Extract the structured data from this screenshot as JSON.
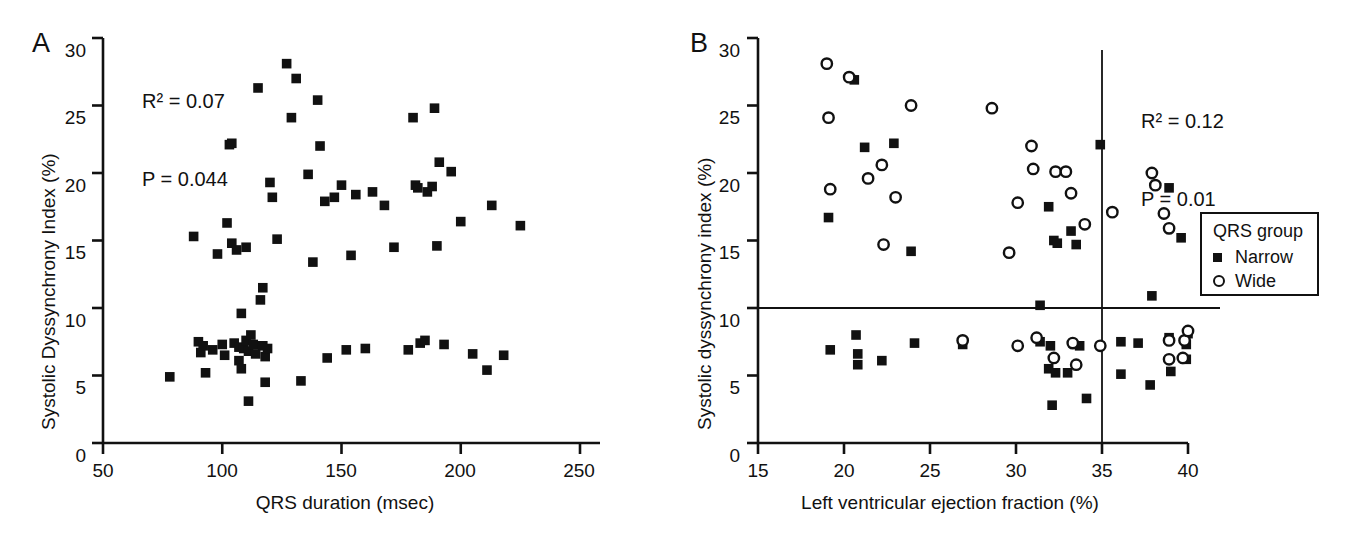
{
  "figure": {
    "background": "#ffffff",
    "ink": "#111111"
  },
  "panels": [
    {
      "id": "A",
      "letter": "A",
      "stats": {
        "r2_label": "R",
        "r2_sup": "2",
        "r2_value": "R² = 0.07",
        "p_value": "P = 0.044"
      },
      "axes": {
        "xlabel": "QRS duration (msec)",
        "ylabel": "Systolic Dyssynchrony Index (%)",
        "xticks": [
          "50",
          "100",
          "150",
          "200",
          "250"
        ],
        "yticks": [
          "0",
          "5",
          "10",
          "15",
          "20",
          "25",
          "30"
        ]
      }
    },
    {
      "id": "B",
      "letter": "B",
      "stats": {
        "r2_value": "R² = 0.12",
        "p_value": "P = 0.01"
      },
      "axes": {
        "xlabel": "Left ventricular ejection fraction (%)",
        "ylabel": "Systolic dyssynchrony index (%)",
        "xticks": [
          "15",
          "20",
          "25",
          "30",
          "35",
          "40"
        ],
        "yticks": [
          "0",
          "5",
          "10",
          "15",
          "20",
          "25",
          "30"
        ]
      }
    }
  ],
  "legend": {
    "title": "QRS group",
    "entries": [
      {
        "marker": "filled-square",
        "label": "Narrow"
      },
      {
        "marker": "open-circle",
        "label": "Wide"
      }
    ]
  },
  "chart_data": [
    {
      "type": "scatter",
      "panel": "A",
      "title": "",
      "xlabel": "QRS duration (msec)",
      "ylabel": "Systolic Dyssynchrony Index (%)",
      "xlim": [
        50,
        250
      ],
      "ylim": [
        0,
        30
      ],
      "xticks": [
        50,
        100,
        150,
        200,
        250
      ],
      "yticks": [
        0,
        5,
        10,
        15,
        20,
        25,
        30
      ],
      "grid": false,
      "legend": "none",
      "annotations": [
        "R² = 0.07",
        "P = 0.044"
      ],
      "series": [
        {
          "name": "All patients",
          "marker": "filled-square",
          "points": [
            [
              78,
              4.9
            ],
            [
              88,
              15.3
            ],
            [
              90,
              7.5
            ],
            [
              91,
              6.7
            ],
            [
              92,
              7.2
            ],
            [
              93,
              5.2
            ],
            [
              96,
              6.9
            ],
            [
              98,
              14.0
            ],
            [
              100,
              7.3
            ],
            [
              101,
              6.5
            ],
            [
              102,
              16.3
            ],
            [
              103,
              22.1
            ],
            [
              104,
              22.2
            ],
            [
              104,
              14.8
            ],
            [
              105,
              7.4
            ],
            [
              106,
              14.3
            ],
            [
              107,
              7.1
            ],
            [
              107,
              6.1
            ],
            [
              108,
              9.6
            ],
            [
              108,
              5.5
            ],
            [
              109,
              7.0
            ],
            [
              110,
              7.6
            ],
            [
              110,
              14.5
            ],
            [
              111,
              6.8
            ],
            [
              111,
              3.1
            ],
            [
              112,
              8.0
            ],
            [
              113,
              7.3
            ],
            [
              114,
              6.6
            ],
            [
              115,
              26.3
            ],
            [
              116,
              10.6
            ],
            [
              117,
              11.5
            ],
            [
              117,
              7.2
            ],
            [
              118,
              6.4
            ],
            [
              118,
              4.5
            ],
            [
              119,
              7.0
            ],
            [
              120,
              19.3
            ],
            [
              121,
              18.2
            ],
            [
              123,
              15.1
            ],
            [
              127,
              28.1
            ],
            [
              129,
              24.1
            ],
            [
              131,
              27.0
            ],
            [
              133,
              4.6
            ],
            [
              136,
              19.9
            ],
            [
              138,
              13.4
            ],
            [
              140,
              25.4
            ],
            [
              141,
              22.0
            ],
            [
              143,
              17.9
            ],
            [
              144,
              6.3
            ],
            [
              147,
              18.2
            ],
            [
              150,
              19.1
            ],
            [
              152,
              6.9
            ],
            [
              154,
              13.9
            ],
            [
              156,
              18.4
            ],
            [
              160,
              7.0
            ],
            [
              163,
              18.6
            ],
            [
              168,
              17.6
            ],
            [
              172,
              14.5
            ],
            [
              178,
              6.9
            ],
            [
              180,
              24.1
            ],
            [
              181,
              19.1
            ],
            [
              182,
              18.9
            ],
            [
              183,
              7.4
            ],
            [
              185,
              7.6
            ],
            [
              186,
              18.6
            ],
            [
              188,
              19.0
            ],
            [
              189,
              24.8
            ],
            [
              190,
              14.6
            ],
            [
              191,
              20.8
            ],
            [
              193,
              7.3
            ],
            [
              196,
              20.1
            ],
            [
              200,
              16.4
            ],
            [
              205,
              6.6
            ],
            [
              211,
              5.4
            ],
            [
              213,
              17.6
            ],
            [
              218,
              6.5
            ],
            [
              225,
              16.1
            ]
          ]
        }
      ]
    },
    {
      "type": "scatter",
      "panel": "B",
      "title": "",
      "xlabel": "Left ventricular ejection fraction (%)",
      "ylabel": "Systolic dyssynchrony index (%)",
      "xlim": [
        15,
        40
      ],
      "ylim": [
        0,
        30
      ],
      "xticks": [
        15,
        20,
        25,
        30,
        35,
        40
      ],
      "yticks": [
        0,
        5,
        10,
        15,
        20,
        25,
        30
      ],
      "grid": false,
      "legend": "right-outside",
      "annotations": [
        "R² = 0.12",
        "P = 0.01"
      ],
      "reference_lines": [
        {
          "orientation": "horizontal",
          "value": 10
        },
        {
          "orientation": "vertical",
          "value": 35
        }
      ],
      "series": [
        {
          "name": "Narrow",
          "marker": "filled-square",
          "points": [
            [
              19.1,
              16.7
            ],
            [
              20.6,
              26.9
            ],
            [
              21.2,
              21.9
            ],
            [
              22.9,
              22.2
            ],
            [
              23.9,
              14.2
            ],
            [
              31.4,
              10.2
            ],
            [
              31.9,
              17.5
            ],
            [
              32.2,
              15.0
            ],
            [
              32.4,
              14.8
            ],
            [
              33.2,
              15.7
            ],
            [
              33.5,
              14.7
            ],
            [
              34.9,
              22.1
            ],
            [
              37.9,
              10.9
            ],
            [
              38.9,
              18.9
            ],
            [
              39.6,
              15.2
            ],
            [
              19.2,
              6.9
            ],
            [
              20.7,
              8.0
            ],
            [
              20.8,
              6.6
            ],
            [
              20.8,
              5.8
            ],
            [
              22.2,
              6.1
            ],
            [
              24.1,
              7.4
            ],
            [
              26.9,
              7.3
            ],
            [
              31.4,
              7.5
            ],
            [
              32.0,
              7.2
            ],
            [
              31.9,
              5.5
            ],
            [
              32.3,
              5.2
            ],
            [
              32.1,
              2.8
            ],
            [
              33.0,
              5.2
            ],
            [
              33.7,
              7.2
            ],
            [
              34.1,
              3.3
            ],
            [
              36.1,
              7.5
            ],
            [
              36.1,
              5.1
            ],
            [
              37.1,
              7.4
            ],
            [
              37.8,
              4.3
            ],
            [
              38.9,
              7.8
            ],
            [
              39.0,
              5.3
            ],
            [
              39.9,
              7.3
            ],
            [
              39.9,
              6.2
            ],
            [
              40.0,
              8.1
            ]
          ]
        },
        {
          "name": "Wide",
          "marker": "open-circle",
          "points": [
            [
              19.0,
              28.1
            ],
            [
              19.1,
              24.1
            ],
            [
              20.3,
              27.1
            ],
            [
              19.2,
              18.8
            ],
            [
              21.4,
              19.6
            ],
            [
              22.2,
              20.6
            ],
            [
              22.3,
              14.7
            ],
            [
              23.0,
              18.2
            ],
            [
              23.9,
              25.0
            ],
            [
              28.6,
              24.8
            ],
            [
              29.6,
              14.1
            ],
            [
              30.1,
              17.8
            ],
            [
              30.9,
              22.0
            ],
            [
              31.0,
              20.3
            ],
            [
              32.3,
              20.1
            ],
            [
              32.9,
              20.1
            ],
            [
              33.2,
              18.5
            ],
            [
              34.0,
              16.2
            ],
            [
              35.6,
              17.1
            ],
            [
              37.9,
              20.0
            ],
            [
              38.1,
              19.1
            ],
            [
              38.6,
              17.0
            ],
            [
              38.9,
              15.9
            ],
            [
              30.1,
              7.2
            ],
            [
              31.2,
              7.8
            ],
            [
              32.2,
              6.3
            ],
            [
              33.3,
              7.4
            ],
            [
              33.5,
              5.8
            ],
            [
              34.9,
              7.2
            ],
            [
              26.9,
              7.6
            ],
            [
              38.9,
              7.6
            ],
            [
              38.9,
              6.2
            ],
            [
              39.8,
              7.6
            ],
            [
              39.7,
              6.3
            ],
            [
              40.0,
              8.3
            ]
          ]
        }
      ]
    }
  ]
}
